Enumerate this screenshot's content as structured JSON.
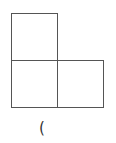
{
  "diagram": {
    "shape": "L-tromino",
    "stroke_color": "#555555",
    "cells": [
      {
        "id": "top-left",
        "row": 0,
        "col": 0
      },
      {
        "id": "bottom-left",
        "row": 1,
        "col": 0
      },
      {
        "id": "bottom-right",
        "row": 1,
        "col": 1
      }
    ],
    "caption": "("
  }
}
